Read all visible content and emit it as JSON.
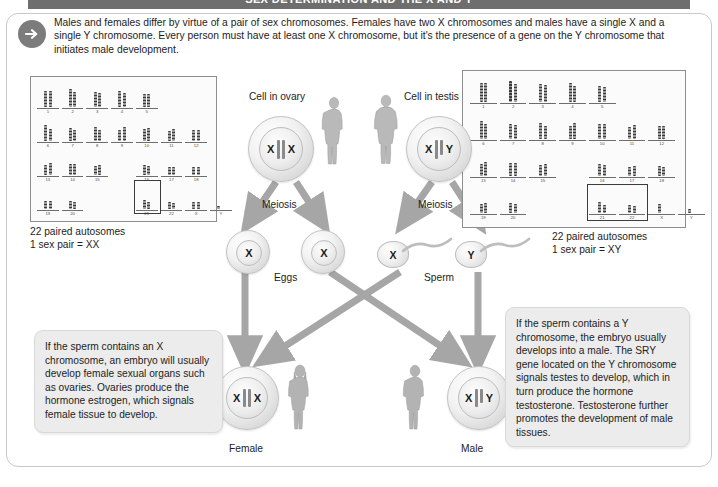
{
  "header": {
    "title": "SEX DETERMINATION AND THE X AND Y"
  },
  "intro": {
    "icon": "arrow-right-circle-icon",
    "text": "Males and females differ by virtue of a pair of sex chromosomes. Females have two X chromosomes and males have a single X and a single Y chromosome. Every person must have at least one X chromosome, but it's the presence of a gene on the Y chromosome that initiates male development."
  },
  "karyotype_female": {
    "caption": "22 paired autosomes\n1 sex pair = XX",
    "rows": [
      [
        "1",
        "2",
        "3",
        "4",
        "5"
      ],
      [
        "6",
        "7",
        "8",
        "9",
        "10",
        "11",
        "12"
      ],
      [
        "13",
        "14",
        "15",
        "16",
        "17",
        "18"
      ],
      [
        "19",
        "20",
        "21",
        "22",
        "X",
        "Y"
      ]
    ],
    "boxed": "X"
  },
  "karyotype_male": {
    "caption": "22 paired autosomes\n1 sex pair = XY",
    "rows": [
      [
        "1",
        "2",
        "3",
        "4",
        "5"
      ],
      [
        "6",
        "7",
        "8",
        "9",
        "10",
        "11",
        "12"
      ],
      [
        "13",
        "14",
        "15",
        "16",
        "17",
        "18"
      ],
      [
        "19",
        "20",
        "21",
        "22",
        "X",
        "Y"
      ]
    ],
    "boxed": "X and Y"
  },
  "parent_cells": {
    "ovary": {
      "label": "Cell in ovary",
      "chromosome_left": "X",
      "chromosome_right": "X"
    },
    "testis": {
      "label": "Cell in testis",
      "chromosome_left": "X",
      "chromosome_right": "Y"
    }
  },
  "meiosis": {
    "left_label": "Meiosis",
    "right_label": "Meiosis"
  },
  "gametes": {
    "eggs_label": "Eggs",
    "egg1": "X",
    "egg2": "X",
    "sperm_label": "Sperm",
    "sperm1": "X",
    "sperm2": "Y"
  },
  "offspring": {
    "female": {
      "label": "Female",
      "chromosome_left": "X",
      "chromosome_right": "X"
    },
    "male": {
      "label": "Male",
      "chromosome_left": "X",
      "chromosome_right": "Y"
    }
  },
  "notes": {
    "female_note": "If the sperm contains an X chromosome, an embryo will usually develop female sexual organs such as ovaries. Ovaries produce the hormone estrogen, which signals female tissue to develop.",
    "male_note": "If the sperm contains a Y chromosome, the embryo usually develops into a male. The SRY gene located on the Y chromosome signals testes to develop, which in turn produce the hormone testosterone. Testosterone further promotes the development of male tissues."
  },
  "colors": {
    "header_bar": "#6e6e6e",
    "arrow_gray": "#9a9a9a",
    "note_bg": "#ececec",
    "frame_border": "#c9c9c9"
  }
}
